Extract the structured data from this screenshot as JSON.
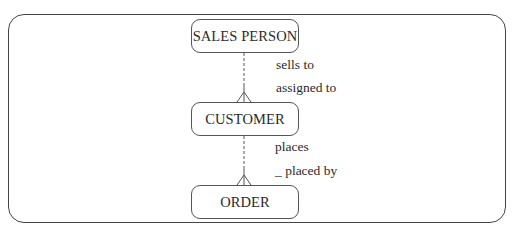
{
  "diagram": {
    "type": "entity-relationship",
    "notation": "crow's foot",
    "entities": [
      {
        "id": "sales_person",
        "label": "SALES PERSON"
      },
      {
        "id": "customer",
        "label": "CUSTOMER"
      },
      {
        "id": "order",
        "label": "ORDER"
      }
    ],
    "relationships": [
      {
        "from": "sales_person",
        "to": "customer",
        "forward_label": "sells to",
        "reverse_label": "assigned to",
        "line_style": "dashed near parent, solid near child",
        "child_end": "crow's foot (many)"
      },
      {
        "from": "customer",
        "to": "order",
        "forward_label": "places",
        "reverse_label": "_ placed by",
        "line_style": "dashed near parent, solid near child",
        "child_end": "crow's foot (many)"
      }
    ]
  },
  "colors": {
    "stroke": "#444444",
    "text": "#2a2a2a",
    "background": "#ffffff"
  }
}
